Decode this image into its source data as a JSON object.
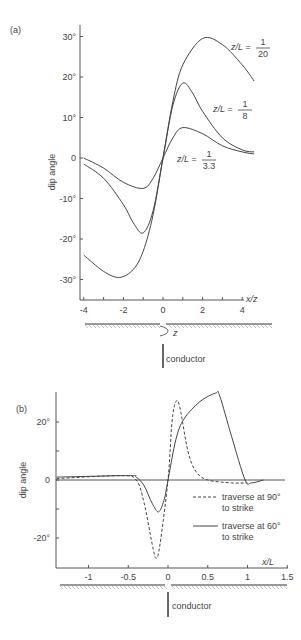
{
  "chart_data": [
    {
      "panel": "(a)",
      "type": "line",
      "title": "",
      "xlabel": "x/z",
      "ylabel": "dip angle",
      "xlim": [
        -4,
        5
      ],
      "ylim": [
        -33,
        33
      ],
      "x_ticks": [
        "-4",
        "-2",
        "0",
        "2",
        "4"
      ],
      "y_ticks": [
        "30°",
        "20°",
        "10°",
        "0",
        "-10°",
        "-20°",
        "-30°"
      ],
      "grid": false,
      "series": [
        {
          "name": "z/L = 1/20",
          "label_num": "1",
          "label_den": "20",
          "x": [
            -4,
            -3,
            -2.2,
            -1.5,
            -1,
            -0.5,
            0,
            0.5,
            1,
            2,
            3,
            4,
            4.6
          ],
          "y": [
            -24,
            -28,
            -29.5,
            -27.5,
            -23,
            -14,
            0,
            14,
            23,
            29.5,
            28,
            23,
            19
          ]
        },
        {
          "name": "z/L = 1/8",
          "label_num": "1",
          "label_den": "8",
          "x": [
            -4,
            -3,
            -2,
            -1.5,
            -1,
            -0.5,
            0,
            0.5,
            1,
            1.5,
            2,
            3,
            4,
            4.6
          ],
          "y": [
            -1.5,
            -5,
            -11.5,
            -16,
            -18.5,
            -13,
            0,
            13,
            18.5,
            16,
            11.5,
            5,
            2,
            1.5
          ]
        },
        {
          "name": "z/L = 1/3.3",
          "label_num": "1",
          "label_den": "3.3",
          "x": [
            -4,
            -3,
            -2,
            -1,
            -0.5,
            0,
            0.5,
            1,
            2,
            3,
            4,
            4.6
          ],
          "y": [
            0,
            -2.5,
            -6,
            -7.5,
            -5,
            0,
            5,
            7.5,
            6,
            3,
            1.5,
            1
          ]
        }
      ],
      "annotations": [
        "z",
        "conductor"
      ]
    },
    {
      "panel": "(b)",
      "type": "line",
      "title": "",
      "xlabel": "x/L",
      "ylabel": "dip angle",
      "xlim": [
        -1.4,
        1.5
      ],
      "ylim": [
        -30,
        32
      ],
      "x_ticks": [
        "-1",
        "-0.5",
        "0",
        "0.5",
        "1",
        "1.5"
      ],
      "y_ticks": [
        "20°",
        "0",
        "-20°"
      ],
      "grid": false,
      "series": [
        {
          "name": "traverse at 90° to strike",
          "style": "dashed",
          "x": [
            -1.4,
            -0.6,
            -0.4,
            -0.3,
            -0.2,
            -0.15,
            -0.1,
            0,
            0.05,
            0.1,
            0.15,
            0.25,
            0.35,
            0.5,
            0.8,
            1.0
          ],
          "y": [
            0.5,
            1.5,
            0,
            -8,
            -22,
            -27,
            -22,
            0,
            20,
            27,
            25,
            10,
            3,
            0,
            -1,
            -1
          ]
        },
        {
          "name": "traverse at 60° to strike",
          "style": "solid",
          "x": [
            -1.4,
            -0.5,
            -0.4,
            -0.3,
            -0.2,
            -0.12,
            -0.05,
            0,
            0.1,
            0.2,
            0.4,
            0.6,
            0.65,
            0.8,
            0.97,
            1.05,
            1.2
          ],
          "y": [
            1,
            1.5,
            1,
            -2,
            -8,
            -11,
            -7,
            0,
            14,
            21,
            27,
            30,
            29,
            15,
            0,
            -1,
            0
          ]
        }
      ],
      "legend": [
        {
          "style": "dashed",
          "line1": "traverse at 90°",
          "line2": "to strike"
        },
        {
          "style": "solid",
          "line1": "traverse at 60°",
          "line2": "to strike"
        }
      ],
      "annotations": [
        "conductor"
      ]
    }
  ],
  "labels": {
    "panel_a": "(a)",
    "panel_b": "(b)",
    "ylabel": "dip angle",
    "xlabel_a": "x/z",
    "xlabel_b": "x/L",
    "depth_label": "z",
    "conductor": "conductor",
    "zl_prefix": "z/L ="
  }
}
